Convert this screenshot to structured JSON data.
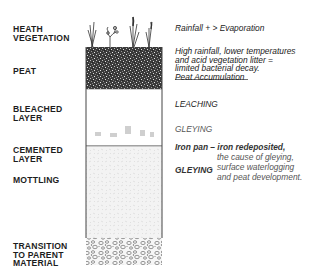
{
  "diagram": {
    "type": "soil-profile",
    "layers": [
      {
        "id": "heath-vegetation",
        "label_lines": [
          "HEATH",
          "VEGETATION"
        ]
      },
      {
        "id": "peat",
        "label_lines": [
          "PEAT"
        ]
      },
      {
        "id": "bleached-layer",
        "label_lines": [
          "BLEACHED",
          "LAYER"
        ]
      },
      {
        "id": "cemented-layer",
        "label_lines": [
          "CEMENTED",
          "LAYER"
        ]
      },
      {
        "id": "mottling",
        "label_lines": [
          "MOTTLING"
        ]
      },
      {
        "id": "transition",
        "label_lines": [
          "TRANSITION",
          "TO PARENT",
          "MATERIAL"
        ]
      }
    ],
    "annotations": {
      "rainfall": "Rainfall + > Evaporation",
      "peat_line1": "High rainfall, lower temperatures",
      "peat_line2": "and acid vegetation litter =",
      "peat_line3": "limited bacterial decay.",
      "peat_accumulation": "Peat Accumulation",
      "leaching": "LEACHING",
      "gleying1": "GLEYING",
      "iron_pan_head": "Iron pan – iron redeposited,",
      "iron_pan_2": "the cause of gleying,",
      "gleying2": "GLEYING",
      "iron_pan_3": "surface waterlogging",
      "iron_pan_4": "and peat development."
    }
  }
}
